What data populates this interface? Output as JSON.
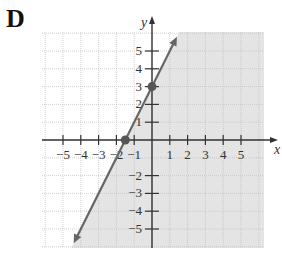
{
  "panel_label": "D",
  "chart_data": {
    "type": "line",
    "title": "",
    "xlabel": "x",
    "ylabel": "y",
    "xlim": [
      -6,
      6
    ],
    "ylim": [
      -6,
      6
    ],
    "grid": true,
    "x_ticks": [
      -5,
      -4,
      -3,
      -2,
      -1,
      1,
      2,
      3,
      4,
      5
    ],
    "y_ticks": [
      -5,
      -4,
      -3,
      -2,
      1,
      2,
      3,
      4,
      5
    ],
    "x_tick_labels": [
      "−5",
      "−4",
      "−3",
      "−2",
      "−1",
      "1",
      "2",
      "3",
      "4",
      "5"
    ],
    "y_tick_labels": [
      "−5",
      "−4",
      "−3",
      "−2",
      "1",
      "2",
      "3",
      "4",
      "5"
    ],
    "series": [
      {
        "name": "boundary line y = 2x + 3",
        "style": "solid",
        "points": [
          {
            "x": -1.5,
            "y": 0
          },
          {
            "x": 0,
            "y": 3
          }
        ],
        "endpoints": [
          {
            "x": -4.3,
            "y": -5.6
          },
          {
            "x": 1.3,
            "y": 5.6
          }
        ]
      }
    ],
    "marked_points": [
      {
        "x": -1.5,
        "y": 0
      },
      {
        "x": 0,
        "y": 3
      }
    ],
    "shaded_region": "below/right of line (y ≤ 2x + 3)",
    "colors": {
      "shade": "#e4e4e4",
      "line": "#666666",
      "grid": "#bdbdbd",
      "axis": "#333333"
    }
  }
}
